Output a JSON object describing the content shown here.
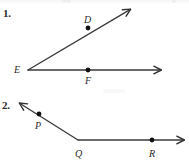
{
  "page": {
    "width": 189,
    "height": 163,
    "background_color": "#ffffff",
    "ink_color": "#333333",
    "label_color": "#2b2b2b"
  },
  "problems": [
    {
      "number_label": "1.",
      "vertex": "E",
      "rays": [
        {
          "name": "ray-ED",
          "from": "E",
          "through": "D",
          "direction": "upper-right"
        },
        {
          "name": "ray-EF",
          "from": "E",
          "through": "F",
          "direction": "right"
        }
      ],
      "points": [
        {
          "label": "D",
          "x": 88,
          "y": 28,
          "label_position": "above-left"
        },
        {
          "label": "E",
          "x": 28,
          "y": 70,
          "label_position": "left"
        },
        {
          "label": "F",
          "x": 88,
          "y": 70,
          "label_position": "below"
        }
      ]
    },
    {
      "number_label": "2.",
      "vertex": "Q",
      "rays": [
        {
          "name": "ray-QP",
          "from": "Q",
          "through": "P",
          "direction": "upper-left"
        },
        {
          "name": "ray-QR",
          "from": "Q",
          "through": "R",
          "direction": "right"
        }
      ],
      "points": [
        {
          "label": "P",
          "x": 39,
          "y": 114,
          "label_position": "below"
        },
        {
          "label": "Q",
          "x": 78,
          "y": 140,
          "label_position": "below"
        },
        {
          "label": "R",
          "x": 152,
          "y": 140,
          "label_position": "below"
        }
      ]
    }
  ],
  "geometry": {
    "figure1": {
      "vertex_x": 28,
      "vertex_y": 70,
      "horizontal_end_x": 163,
      "horizontal_end_y": 70,
      "diagonal_end_x": 132,
      "diagonal_end_y": 8,
      "point_D_x": 88,
      "point_D_y": 28,
      "point_F_x": 88,
      "point_F_y": 70
    },
    "figure2": {
      "vertex_x": 78,
      "vertex_y": 140,
      "upper_left_end_x": 18,
      "upper_left_end_y": 102,
      "horizontal_end_x": 186,
      "horizontal_end_y": 140,
      "point_P_x": 39,
      "point_P_y": 114,
      "point_R_x": 152,
      "point_R_y": 140
    }
  }
}
